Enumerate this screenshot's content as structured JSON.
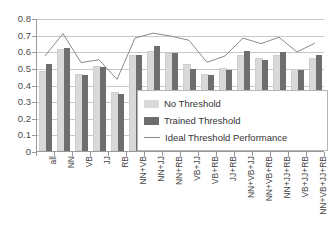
{
  "chart_data": {
    "type": "bar",
    "title": "",
    "xlabel": "",
    "ylabel": "",
    "ylim": [
      0,
      0.8
    ],
    "yticks": [
      "0",
      "0.1",
      "0.2",
      "0.3",
      "0.4",
      "0.5",
      "0.6",
      "0.7",
      "0.8"
    ],
    "grid": true,
    "legend_position": "inside-bottom-right",
    "categories": [
      "all",
      "NN",
      "VB",
      "JJ",
      "RB",
      "NN+VB",
      "NN+JJ",
      "NN+RB",
      "VB+JJ",
      "VB+RB",
      "JJ+RB",
      "NN+VB+JJ",
      "NN+VB+RB",
      "NN+JJ+RB",
      "VB+JJ+RB",
      "NN+VB+JJ+RB"
    ],
    "series": [
      {
        "name": "No Threshold",
        "color": "#d9d9d9",
        "type": "bar",
        "values": [
          0.47,
          0.6,
          0.45,
          0.5,
          0.34,
          0.565,
          0.59,
          0.575,
          0.51,
          0.45,
          0.485,
          0.565,
          0.545,
          0.565,
          0.48,
          0.545
        ]
      },
      {
        "name": "Trained Threshold",
        "color": "#6e6e6e",
        "type": "bar",
        "values": [
          0.525,
          0.62,
          0.455,
          0.505,
          0.345,
          0.58,
          0.63,
          0.59,
          0.495,
          0.455,
          0.49,
          0.6,
          0.545,
          0.595,
          0.485,
          0.575
        ]
      },
      {
        "name": "Ideal Threshold Performance",
        "color": "#8a8a8a",
        "type": "line",
        "values": [
          0.578,
          0.712,
          0.538,
          0.555,
          0.437,
          0.685,
          0.715,
          0.697,
          0.672,
          0.539,
          0.578,
          0.685,
          0.652,
          0.69,
          0.602,
          0.655
        ]
      }
    ]
  },
  "legend": {
    "items": [
      {
        "label": "No Threshold",
        "swatch": "light"
      },
      {
        "label": "Trained Threshold",
        "swatch": "dark"
      },
      {
        "label": "Ideal Threshold Performance",
        "swatch": "line"
      }
    ]
  }
}
